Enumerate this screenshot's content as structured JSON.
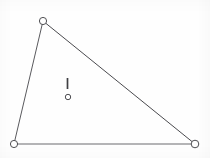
{
  "figure": {
    "background_color": "#fefefe",
    "width": 210,
    "height": 158
  },
  "chart_data": {
    "type": "scatter",
    "xlabel": "",
    "ylabel": "",
    "xlim": [
      0,
      210
    ],
    "ylim": [
      0,
      158
    ],
    "grid": false,
    "legend": null,
    "shapes": [
      {
        "name": "triangle",
        "type": "polygon",
        "closed": true,
        "stroke_color": "#555558",
        "stroke_width": 1,
        "fill": "none",
        "points": [
          {
            "label": "top-vertex",
            "x": 43,
            "y": 21
          },
          {
            "label": "bottom-right-vertex",
            "x": 195,
            "y": 144
          },
          {
            "label": "bottom-left-vertex",
            "x": 14,
            "y": 144
          }
        ]
      }
    ],
    "vertex_markers": [
      {
        "label": "top-vertex",
        "x": 43,
        "y": 21,
        "radius": 3.6,
        "fill": "#ffffff",
        "stroke_color": "#4e4e52",
        "stroke_width": 1
      },
      {
        "label": "bottom-left-vertex",
        "x": 14,
        "y": 144,
        "radius": 3.6,
        "fill": "#ffffff",
        "stroke_color": "#4e4e52",
        "stroke_width": 1
      },
      {
        "label": "bottom-right-vertex",
        "x": 195,
        "y": 144,
        "radius": 3.8,
        "fill": "#ffffff",
        "stroke_color": "#4e4e52",
        "stroke_width": 1
      }
    ],
    "annotations": [
      {
        "name": "interior-tick",
        "type": "vertical-line",
        "x": 67.5,
        "y_start": 78,
        "y_end": 89,
        "stroke_color": "#3f3f43",
        "stroke_width": 1.7
      },
      {
        "name": "interior-dot",
        "type": "circle",
        "x": 68,
        "y": 97,
        "radius": 2.7,
        "fill": "#ffffff",
        "stroke_color": "#4e4e52",
        "stroke_width": 1
      }
    ],
    "edges": [
      {
        "name": "left-edge",
        "from": "top-vertex",
        "to": "bottom-left-vertex",
        "stroke_color": "#5a5a5e",
        "stroke_width": 1
      },
      {
        "name": "hypotenuse-edge",
        "from": "top-vertex",
        "to": "bottom-right-vertex",
        "stroke_color": "#4a4a4e",
        "stroke_width": 1
      },
      {
        "name": "bottom-edge",
        "from": "bottom-left-vertex",
        "to": "bottom-right-vertex",
        "stroke_color": "#6a6a6e",
        "stroke_width": 1.2
      }
    ]
  }
}
